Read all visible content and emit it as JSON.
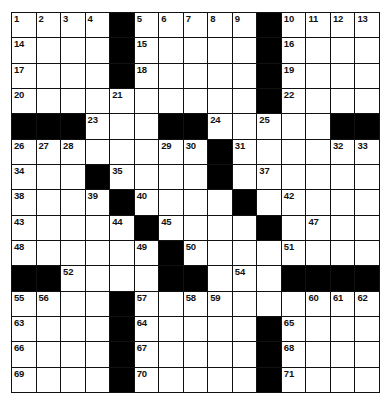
{
  "puzzle": {
    "rows": 15,
    "cols": 15,
    "colors": {
      "block": "#000000",
      "cell": "#ffffff",
      "line": "#111111"
    },
    "layout": [
      "....#.....#....",
      "....#.....#....",
      "....#.....#....",
      "..........#....",
      "###...##.....##",
      "........#......",
      "...#....#......",
      "....#....#.....",
      ".....#....#....",
      "......#........",
      "##....##...####",
      "....#..........",
      "....#.....#....",
      "....#.....#....",
      "....#.....#...."
    ],
    "numbers": [
      {
        "r": 0,
        "c": 0,
        "n": "1"
      },
      {
        "r": 0,
        "c": 1,
        "n": "2"
      },
      {
        "r": 0,
        "c": 2,
        "n": "3"
      },
      {
        "r": 0,
        "c": 3,
        "n": "4"
      },
      {
        "r": 0,
        "c": 5,
        "n": "5"
      },
      {
        "r": 0,
        "c": 6,
        "n": "6"
      },
      {
        "r": 0,
        "c": 7,
        "n": "7"
      },
      {
        "r": 0,
        "c": 8,
        "n": "8"
      },
      {
        "r": 0,
        "c": 9,
        "n": "9"
      },
      {
        "r": 0,
        "c": 11,
        "n": "10"
      },
      {
        "r": 0,
        "c": 12,
        "n": "11"
      },
      {
        "r": 0,
        "c": 13,
        "n": "12"
      },
      {
        "r": 0,
        "c": 14,
        "n": "13"
      },
      {
        "r": 1,
        "c": 0,
        "n": "14"
      },
      {
        "r": 1,
        "c": 5,
        "n": "15"
      },
      {
        "r": 1,
        "c": 11,
        "n": "16"
      },
      {
        "r": 2,
        "c": 0,
        "n": "17"
      },
      {
        "r": 2,
        "c": 5,
        "n": "18"
      },
      {
        "r": 2,
        "c": 11,
        "n": "19"
      },
      {
        "r": 3,
        "c": 0,
        "n": "20"
      },
      {
        "r": 3,
        "c": 4,
        "n": "21"
      },
      {
        "r": 3,
        "c": 11,
        "n": "22"
      },
      {
        "r": 4,
        "c": 3,
        "n": "23"
      },
      {
        "r": 4,
        "c": 8,
        "n": "24"
      },
      {
        "r": 4,
        "c": 10,
        "n": "25"
      },
      {
        "r": 5,
        "c": 0,
        "n": "26"
      },
      {
        "r": 5,
        "c": 1,
        "n": "27"
      },
      {
        "r": 5,
        "c": 2,
        "n": "28"
      },
      {
        "r": 5,
        "c": 6,
        "n": "29"
      },
      {
        "r": 5,
        "c": 7,
        "n": "30"
      },
      {
        "r": 5,
        "c": 9,
        "n": "31"
      },
      {
        "r": 5,
        "c": 13,
        "n": "32"
      },
      {
        "r": 5,
        "c": 14,
        "n": "33"
      },
      {
        "r": 6,
        "c": 0,
        "n": "34"
      },
      {
        "r": 6,
        "c": 4,
        "n": "35"
      },
      {
        "r": 6,
        "c": 8,
        "n": "36"
      },
      {
        "r": 6,
        "c": 10,
        "n": "37"
      },
      {
        "r": 7,
        "c": 0,
        "n": "38"
      },
      {
        "r": 7,
        "c": 3,
        "n": "39"
      },
      {
        "r": 7,
        "c": 5,
        "n": "40"
      },
      {
        "r": 7,
        "c": 9,
        "n": "41"
      },
      {
        "r": 7,
        "c": 11,
        "n": "42"
      },
      {
        "r": 8,
        "c": 0,
        "n": "43"
      },
      {
        "r": 8,
        "c": 4,
        "n": "44"
      },
      {
        "r": 8,
        "c": 6,
        "n": "45"
      },
      {
        "r": 8,
        "c": 10,
        "n": "46"
      },
      {
        "r": 8,
        "c": 12,
        "n": "47"
      },
      {
        "r": 9,
        "c": 0,
        "n": "48"
      },
      {
        "r": 9,
        "c": 5,
        "n": "49"
      },
      {
        "r": 9,
        "c": 7,
        "n": "50"
      },
      {
        "r": 9,
        "c": 11,
        "n": "51"
      },
      {
        "r": 10,
        "c": 2,
        "n": "52"
      },
      {
        "r": 10,
        "c": 6,
        "n": "53"
      },
      {
        "r": 10,
        "c": 9,
        "n": "54"
      },
      {
        "r": 11,
        "c": 0,
        "n": "55"
      },
      {
        "r": 11,
        "c": 1,
        "n": "56"
      },
      {
        "r": 11,
        "c": 5,
        "n": "57"
      },
      {
        "r": 11,
        "c": 7,
        "n": "58"
      },
      {
        "r": 11,
        "c": 8,
        "n": "59"
      },
      {
        "r": 11,
        "c": 12,
        "n": "60"
      },
      {
        "r": 11,
        "c": 13,
        "n": "61"
      },
      {
        "r": 11,
        "c": 14,
        "n": "62"
      },
      {
        "r": 12,
        "c": 0,
        "n": "63"
      },
      {
        "r": 12,
        "c": 5,
        "n": "64"
      },
      {
        "r": 12,
        "c": 11,
        "n": "65"
      },
      {
        "r": 13,
        "c": 0,
        "n": "66"
      },
      {
        "r": 13,
        "c": 5,
        "n": "67"
      },
      {
        "r": 13,
        "c": 11,
        "n": "68"
      },
      {
        "r": 14,
        "c": 0,
        "n": "69"
      },
      {
        "r": 14,
        "c": 5,
        "n": "70"
      },
      {
        "r": 14,
        "c": 11,
        "n": "71"
      }
    ]
  }
}
